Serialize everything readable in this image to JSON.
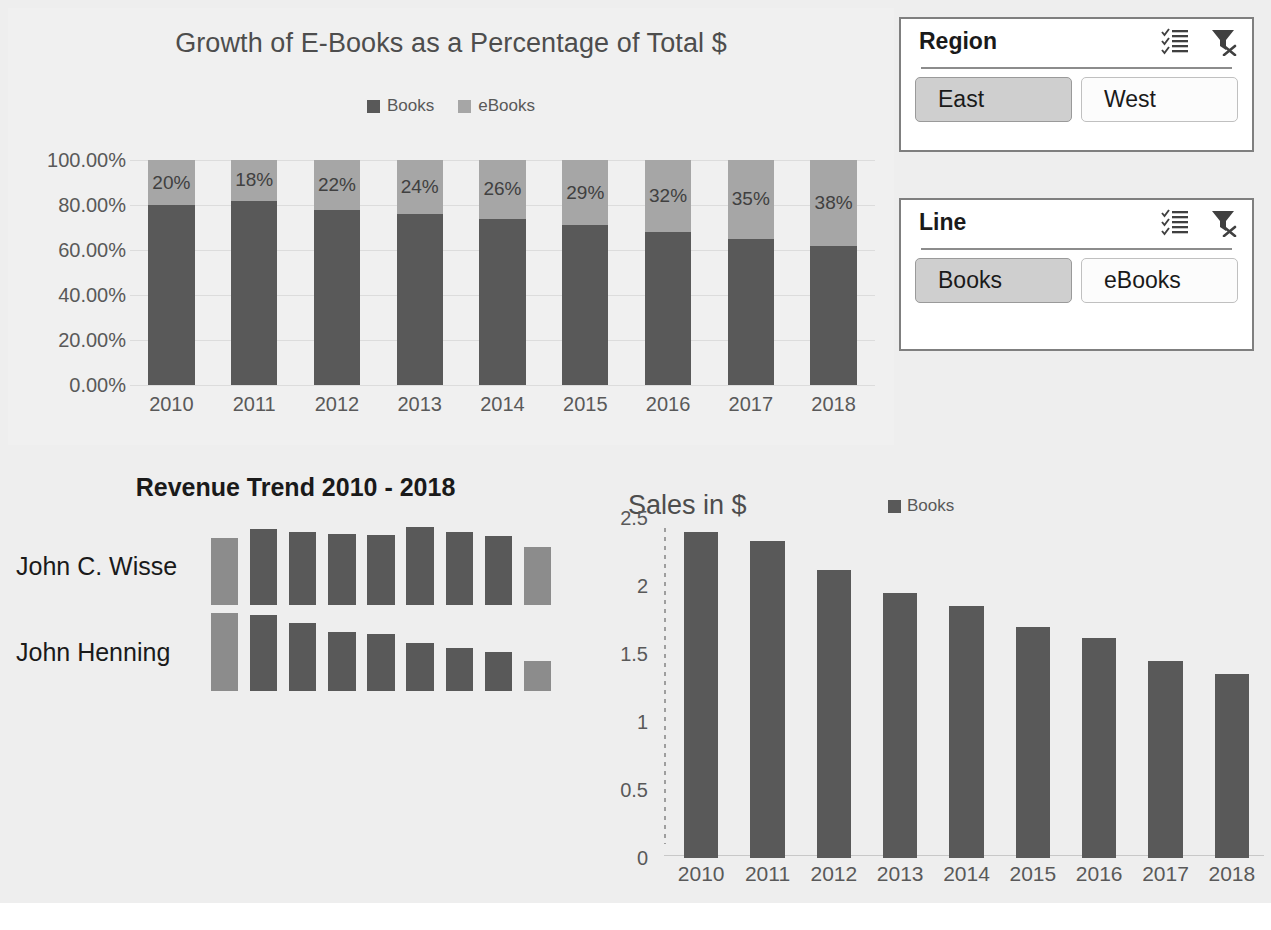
{
  "theme": {
    "series_books_color": "#595959",
    "series_ebooks_color": "#a6a6a6",
    "trend_highlight_color": "#8c8c8c",
    "panel_background": "#f0f0f0",
    "page_background": "#eeeeee",
    "slicer_selected_background": "#cfcfcf",
    "axis_text_color": "#595959"
  },
  "stacked_chart": {
    "title": "Growth of E-Books as a Percentage of Total $",
    "legend": [
      {
        "label": "Books",
        "color": "#595959",
        "swatch": "legend-square-books"
      },
      {
        "label": "eBooks",
        "color": "#a6a6a6",
        "swatch": "legend-square-ebooks"
      }
    ],
    "y_ticks": [
      "100.00%",
      "80.00%",
      "60.00%",
      "40.00%",
      "20.00%",
      "0.00%"
    ]
  },
  "slicers": [
    {
      "title": "Region",
      "multiselect_icon": "multi-select-checklist-icon",
      "clear_filter_icon": "clear-filter-funnel-x-icon",
      "items": [
        {
          "label": "East",
          "selected": true
        },
        {
          "label": "West",
          "selected": false
        }
      ]
    },
    {
      "title": "Line",
      "multiselect_icon": "multi-select-checklist-icon",
      "clear_filter_icon": "clear-filter-funnel-x-icon",
      "items": [
        {
          "label": "Books",
          "selected": true
        },
        {
          "label": "eBooks",
          "selected": false
        }
      ]
    }
  ],
  "trend_chart": {
    "title": "Revenue Trend 2010 - 2018",
    "rows": [
      {
        "label": "John C. Wisse"
      },
      {
        "label": "John Henning"
      }
    ]
  },
  "sales_chart": {
    "title": "Sales in $",
    "legend": [
      {
        "label": "Books",
        "color": "#595959",
        "swatch": "legend-square-books"
      }
    ]
  },
  "chart_data": [
    {
      "id": "stacked-100-percent-bars",
      "type": "bar",
      "stacked": true,
      "normalized": "100%",
      "title": "Growth of E-Books as a Percentage of Total $",
      "xlabel": "",
      "ylabel": "",
      "categories": [
        "2010",
        "2011",
        "2012",
        "2013",
        "2014",
        "2015",
        "2016",
        "2017",
        "2018"
      ],
      "series": [
        {
          "name": "Books",
          "color": "#595959",
          "values": [
            80,
            82,
            78,
            76,
            74,
            71,
            68,
            65,
            62
          ],
          "value_labels": [
            "",
            "",
            "",
            "",
            "",
            "",
            "",
            "",
            ""
          ]
        },
        {
          "name": "eBooks",
          "color": "#a6a6a6",
          "values": [
            20,
            18,
            22,
            24,
            26,
            29,
            32,
            35,
            38
          ],
          "value_labels": [
            "20%",
            "18%",
            "22%",
            "24%",
            "26%",
            "29%",
            "32%",
            "35%",
            "38%"
          ]
        }
      ],
      "ylim": [
        0,
        100
      ],
      "y_tick_values": [
        100,
        80,
        60,
        40,
        20,
        0
      ],
      "y_tick_labels": [
        "100.00%",
        "80.00%",
        "60.00%",
        "40.00%",
        "20.00%",
        "0.00%"
      ],
      "grid": true,
      "legend_position": "top"
    },
    {
      "id": "revenue-trend-sparkline-bars",
      "type": "bar",
      "title": "Revenue Trend 2010 - 2018",
      "orientation": "vertical-grouped-by-row",
      "categories": [
        "2010",
        "2011",
        "2012",
        "2013",
        "2014",
        "2015",
        "2016",
        "2017",
        "2018"
      ],
      "series": [
        {
          "name": "John C. Wisse",
          "values": [
            0.86,
            0.97,
            0.93,
            0.91,
            0.9,
            1.0,
            0.93,
            0.88,
            0.74
          ],
          "first_last_highlighted": true
        },
        {
          "name": "John Henning",
          "values": [
            1.0,
            0.97,
            0.87,
            0.76,
            0.73,
            0.61,
            0.55,
            0.5,
            0.38
          ],
          "first_last_highlighted": true
        }
      ],
      "ylim": [
        0,
        1
      ],
      "grid": false,
      "legend_position": "none",
      "axis_labels_shown": false
    },
    {
      "id": "sales-in-dollars-bars",
      "type": "bar",
      "title": "Sales in $",
      "xlabel": "",
      "ylabel": "",
      "categories": [
        "2010",
        "2011",
        "2012",
        "2013",
        "2014",
        "2015",
        "2016",
        "2017",
        "2018"
      ],
      "series": [
        {
          "name": "Books",
          "color": "#595959",
          "values": [
            2.4,
            2.33,
            2.12,
            1.95,
            1.85,
            1.7,
            1.62,
            1.45,
            1.35
          ]
        }
      ],
      "ylim": [
        0,
        2.5
      ],
      "y_tick_values": [
        2.5,
        2,
        1.5,
        1,
        0.5,
        0
      ],
      "y_tick_labels": [
        "2.5",
        "2",
        "1.5",
        "1",
        "0.5",
        "0"
      ],
      "grid": false,
      "legend_position": "top-right"
    }
  ]
}
